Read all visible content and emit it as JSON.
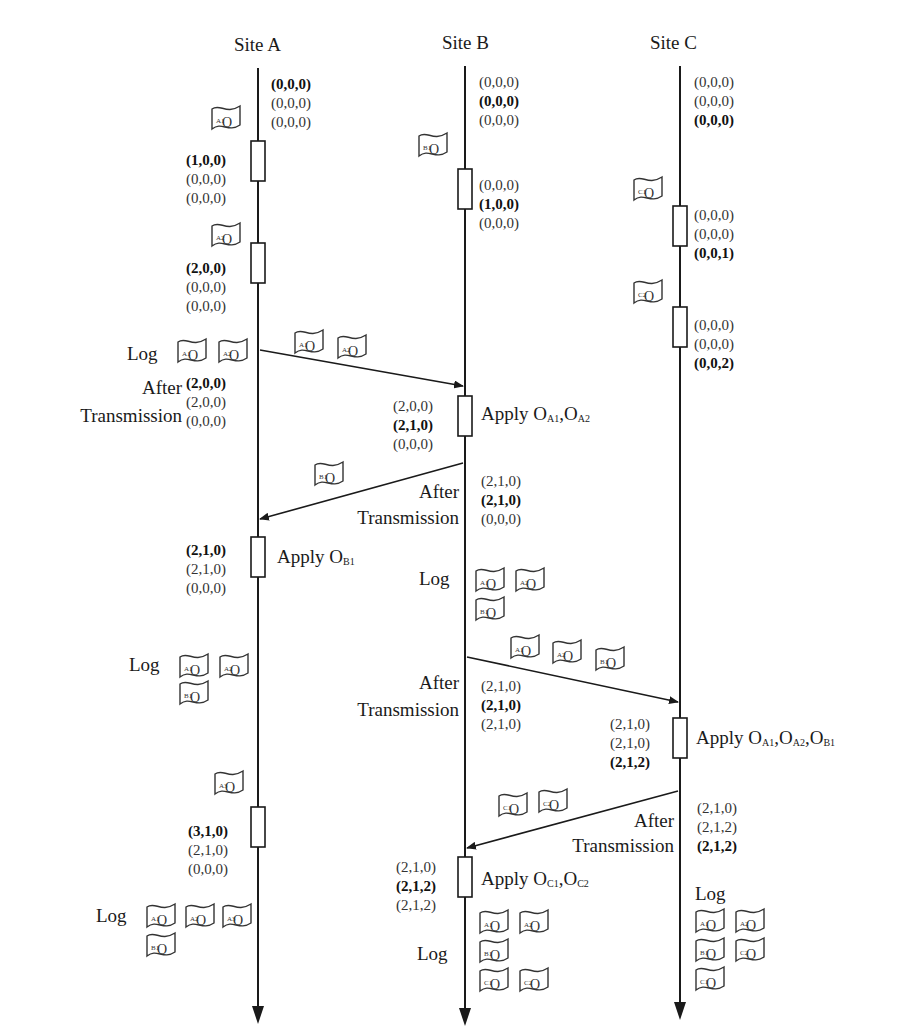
{
  "sites": [
    {
      "id": "A",
      "title": "Site A"
    },
    {
      "id": "B",
      "title": "Site B"
    },
    {
      "id": "C",
      "title": "Site C"
    }
  ],
  "labels": {
    "log": "Log",
    "after": "After",
    "transmission": "Transmission",
    "apply": "Apply"
  },
  "vectors": {
    "a0": [
      "(0,0,0)",
      "(0,0,0)",
      "(0,0,0)"
    ],
    "a1": [
      "(1,0,0)",
      "(0,0,0)",
      "(0,0,0)"
    ],
    "a2": [
      "(2,0,0)",
      "(0,0,0)",
      "(0,0,0)"
    ],
    "a3": [
      "(2,0,0)",
      "(2,0,0)",
      "(0,0,0)"
    ],
    "a4": [
      "(2,1,0)",
      "(2,1,0)",
      "(0,0,0)"
    ],
    "a5": [
      "(3,1,0)",
      "(2,1,0)",
      "(0,0,0)"
    ],
    "b0": [
      "(0,0,0)",
      "(0,0,0)",
      "(0,0,0)"
    ],
    "b1": [
      "(0,0,0)",
      "(1,0,0)",
      "(0,0,0)"
    ],
    "b2": [
      "(2,0,0)",
      "(2,1,0)",
      "(0,0,0)"
    ],
    "b3": [
      "(2,1,0)",
      "(2,1,0)",
      "(0,0,0)"
    ],
    "b4": [
      "(2,1,0)",
      "(2,1,0)",
      "(2,1,0)"
    ],
    "b5": [
      "(2,1,0)",
      "(2,1,2)",
      "(2,1,2)"
    ],
    "c0": [
      "(0,0,0)",
      "(0,0,0)",
      "(0,0,0)"
    ],
    "c1": [
      "(0,0,0)",
      "(0,0,0)",
      "(0,0,1)"
    ],
    "c2": [
      "(0,0,0)",
      "(0,0,0)",
      "(0,0,2)"
    ],
    "c3": [
      "(2,1,0)",
      "(2,1,0)",
      "(2,1,2)"
    ],
    "c4": [
      "(2,1,0)",
      "(2,1,2)",
      "(2,1,2)"
    ]
  },
  "operations": {
    "A1": {
      "base": "O",
      "sub": "A1"
    },
    "A2": {
      "base": "O",
      "sub": "A2"
    },
    "A3": {
      "base": "O",
      "sub": "A3"
    },
    "B1": {
      "base": "O",
      "sub": "B1"
    },
    "C1": {
      "base": "O",
      "sub": "C1"
    },
    "C2": {
      "base": "O",
      "sub": "C2"
    }
  },
  "apply_events": {
    "b_apply": {
      "prefix": "Apply ",
      "ops": [
        "A1",
        "A2"
      ]
    },
    "a_apply": {
      "prefix": "Apply ",
      "ops": [
        "B1"
      ]
    },
    "c_apply": {
      "prefix": "Apply ",
      "ops": [
        "A1",
        "A2",
        "B1"
      ]
    },
    "b_apply2": {
      "prefix": "Apply ",
      "ops": [
        "C1",
        "C2"
      ]
    }
  },
  "messages": [
    {
      "from": "A",
      "to": "B",
      "ops": [
        "A1",
        "A2"
      ]
    },
    {
      "from": "B",
      "to": "A",
      "ops": [
        "B1"
      ]
    },
    {
      "from": "B",
      "to": "C",
      "ops": [
        "A1",
        "A2",
        "B1"
      ]
    },
    {
      "from": "C",
      "to": "B",
      "ops": [
        "C1",
        "C2"
      ]
    }
  ],
  "colors": {
    "line": "#1a1a1a",
    "text": "#1a1a1a",
    "background": "#ffffff"
  }
}
